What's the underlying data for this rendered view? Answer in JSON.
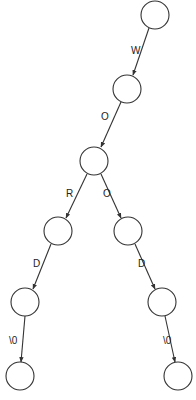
{
  "diagram": {
    "type": "trie",
    "colors": {
      "stroke": "#333333",
      "background": "#ffffff",
      "text": "#222222"
    },
    "nodes": [
      {
        "id": "n0",
        "cx": 155,
        "cy": 15
      },
      {
        "id": "n1",
        "cx": 127,
        "cy": 89
      },
      {
        "id": "n2",
        "cx": 94,
        "cy": 161
      },
      {
        "id": "n3",
        "cx": 58,
        "cy": 231
      },
      {
        "id": "n4",
        "cx": 128,
        "cy": 231
      },
      {
        "id": "n5",
        "cx": 25,
        "cy": 302
      },
      {
        "id": "n6",
        "cx": 162,
        "cy": 302
      },
      {
        "id": "n7",
        "cx": 20,
        "cy": 376
      },
      {
        "id": "n8",
        "cx": 178,
        "cy": 376
      }
    ],
    "edges": [
      {
        "from": "n0",
        "to": "n1",
        "label": "W"
      },
      {
        "from": "n1",
        "to": "n2",
        "label": "O"
      },
      {
        "from": "n2",
        "to": "n3",
        "label": "R"
      },
      {
        "from": "n2",
        "to": "n4",
        "label": "O"
      },
      {
        "from": "n3",
        "to": "n5",
        "label": "D"
      },
      {
        "from": "n4",
        "to": "n6",
        "label": "D"
      },
      {
        "from": "n5",
        "to": "n7",
        "label": "\\0"
      },
      {
        "from": "n6",
        "to": "n8",
        "label": "\\0"
      }
    ]
  }
}
